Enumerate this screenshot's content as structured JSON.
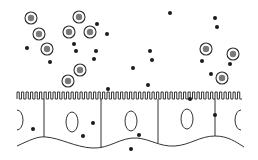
{
  "diagram": {
    "colors": {
      "background": "#ffffff",
      "line": "#333333",
      "dot": "#1a1a1a",
      "ring": "#2a2a2a",
      "ring_core": "#7a7a7a"
    },
    "ringed_particles": [
      {
        "x": 31,
        "y": 18
      },
      {
        "x": 39,
        "y": 34
      },
      {
        "x": 47,
        "y": 49
      },
      {
        "x": 79,
        "y": 17
      },
      {
        "x": 69,
        "y": 32
      },
      {
        "x": 90,
        "y": 32
      },
      {
        "x": 80,
        "y": 70
      },
      {
        "x": 68,
        "y": 81
      },
      {
        "x": 206,
        "y": 49
      },
      {
        "x": 233,
        "y": 54
      },
      {
        "x": 222,
        "y": 78
      }
    ],
    "free_dots": [
      {
        "x": 27,
        "y": 48
      },
      {
        "x": 50,
        "y": 62
      },
      {
        "x": 97,
        "y": 24
      },
      {
        "x": 107,
        "y": 34
      },
      {
        "x": 74,
        "y": 44
      },
      {
        "x": 76,
        "y": 51
      },
      {
        "x": 96,
        "y": 51
      },
      {
        "x": 94,
        "y": 59
      },
      {
        "x": 170,
        "y": 13
      },
      {
        "x": 215,
        "y": 18
      },
      {
        "x": 217,
        "y": 27
      },
      {
        "x": 150,
        "y": 51
      },
      {
        "x": 152,
        "y": 60
      },
      {
        "x": 133,
        "y": 68
      },
      {
        "x": 202,
        "y": 61
      },
      {
        "x": 230,
        "y": 64
      },
      {
        "x": 211,
        "y": 74
      },
      {
        "x": 148,
        "y": 85
      },
      {
        "x": 108,
        "y": 89
      },
      {
        "x": 190,
        "y": 99
      },
      {
        "x": 33,
        "y": 129
      },
      {
        "x": 93,
        "y": 123
      },
      {
        "x": 83,
        "y": 136
      },
      {
        "x": 139,
        "y": 135
      },
      {
        "x": 131,
        "y": 149
      },
      {
        "x": 215,
        "y": 115
      }
    ],
    "microvilli": {
      "x_start": 17,
      "x_end": 244,
      "y_top": 92,
      "y_bottom": 99,
      "pitch": 4.5
    },
    "cell_dividers": [
      44,
      101,
      158,
      215
    ],
    "nuclei": [
      {
        "cx": 72,
        "cy": 122,
        "rx": 6,
        "ry": 10
      },
      {
        "cx": 131,
        "cy": 121,
        "rx": 6,
        "ry": 10
      },
      {
        "cx": 187,
        "cy": 119,
        "rx": 6,
        "ry": 10
      }
    ],
    "partial_nuclei": [
      {
        "side": "left",
        "cx": 17,
        "cy": 120
      },
      {
        "side": "right",
        "cx": 241,
        "cy": 120
      }
    ]
  }
}
